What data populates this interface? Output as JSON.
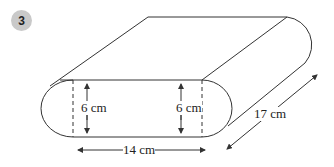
{
  "problem": {
    "number": "3"
  },
  "diagram": {
    "shape": "prism with stadium-shaped (semicircle-ended) cross-section",
    "labels": {
      "left_height": "6 cm",
      "right_height": "6 cm",
      "width": "14 cm",
      "depth": "17 cm"
    },
    "colors": {
      "line": "#333333",
      "badge": "#c9c9c9"
    }
  }
}
